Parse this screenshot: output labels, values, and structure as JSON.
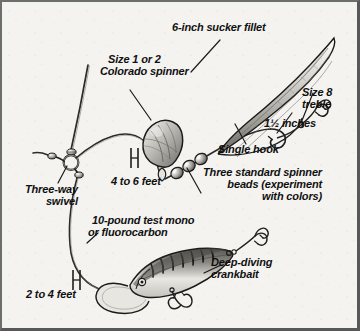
{
  "diagram": {
    "style": {
      "paper": "#f4f3f0",
      "ink": "#1a1a1a",
      "frame_outer": "#58585a",
      "frame_inner": "#cfcdc8",
      "line": "#2b2b2b"
    }
  },
  "labels": {
    "sucker_fillet": "6-inch sucker fillet",
    "colorado_spinner_line1": "Size 1 or 2",
    "colorado_spinner_line2": "Colorado spinner",
    "treble_line1": "Size 8",
    "treble_line2": "treble",
    "inches": "1½ inches",
    "single_hook": "Single hook",
    "beads_line1": "Three standard spinner",
    "beads_line2": "beads (experiment",
    "beads_line3": "with colors)",
    "three_way_line1": "Three-way",
    "three_way_line2": "swivel",
    "four_to_six_feet": "4 to 6 feet",
    "mono_line1": "10-pound test mono",
    "mono_line2": "or fluorocarbon",
    "two_to_four_feet": "2 to 4 feet",
    "crankbait_line1": "Deep-diving",
    "crankbait_line2": "crankbait"
  },
  "components": [
    {
      "name": "main-line",
      "label": "main line"
    },
    {
      "name": "three-way-swivel",
      "label": "Three-way swivel"
    },
    {
      "name": "colorado-spinner-blade",
      "label": "Size 1 or 2 Colorado spinner"
    },
    {
      "name": "spinner-beads",
      "label": "Three standard spinner beads",
      "count": 3
    },
    {
      "name": "single-hook",
      "label": "Single hook"
    },
    {
      "name": "sucker-fillet",
      "label": "6-inch sucker fillet",
      "length": "6 inches"
    },
    {
      "name": "treble-hook",
      "label": "Size 8 treble",
      "size": "8"
    },
    {
      "name": "deep-diving-crankbait",
      "label": "Deep-diving crankbait"
    }
  ],
  "measurements": [
    {
      "name": "spinner-dropper-length",
      "value": "4 to 6 feet"
    },
    {
      "name": "crankbait-dropper-length",
      "value": "2 to 4 feet"
    },
    {
      "name": "hook-to-treble-spacing",
      "value": "1½ inches"
    },
    {
      "name": "leader-material",
      "value": "10-pound test mono or fluorocarbon"
    }
  ]
}
